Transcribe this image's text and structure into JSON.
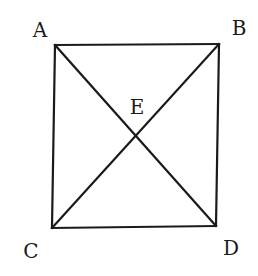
{
  "diagram": {
    "type": "geometry",
    "shape": "square with diagonals",
    "stroke_color": "#1a1a1a",
    "background": "#ffffff",
    "points": {
      "A": {
        "label": "A",
        "x": 55,
        "y": 45,
        "label_x": 40,
        "label_y": 37
      },
      "B": {
        "label": "B",
        "x": 219,
        "y": 44,
        "label_x": 239,
        "label_y": 35
      },
      "C": {
        "label": "C",
        "x": 52,
        "y": 228,
        "label_x": 31,
        "label_y": 258
      },
      "D": {
        "label": "D",
        "x": 216,
        "y": 226,
        "label_x": 231,
        "label_y": 255
      },
      "E": {
        "label": "E",
        "x": 135,
        "y": 137,
        "label_x": 137,
        "label_y": 114
      }
    },
    "segments": [
      {
        "from": "A",
        "to": "B"
      },
      {
        "from": "B",
        "to": "D"
      },
      {
        "from": "D",
        "to": "C"
      },
      {
        "from": "C",
        "to": "A"
      },
      {
        "from": "A",
        "to": "D"
      },
      {
        "from": "B",
        "to": "C"
      }
    ]
  }
}
